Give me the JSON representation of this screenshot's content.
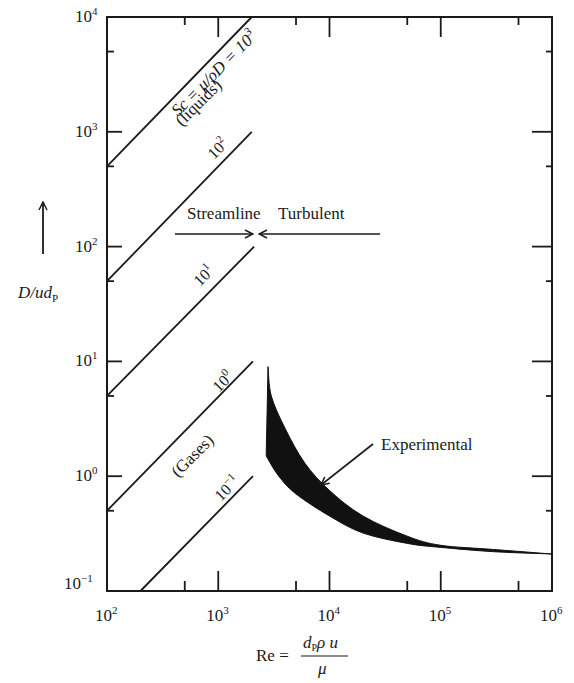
{
  "chart_data": {
    "type": "line",
    "title": "",
    "xlabel": "Re = d_P ρ u / μ",
    "ylabel": "D/ud_P",
    "xscale": "log",
    "yscale": "log",
    "xlim": [
      100,
      1000000
    ],
    "ylim": [
      0.1,
      10000
    ],
    "grid": false,
    "x_ticks": [
      {
        "value": 100,
        "label_base": "10",
        "label_exp": "2"
      },
      {
        "value": 1000,
        "label_base": "10",
        "label_exp": "3"
      },
      {
        "value": 10000,
        "label_base": "10",
        "label_exp": "4"
      },
      {
        "value": 100000,
        "label_base": "10",
        "label_exp": "5"
      },
      {
        "value": 1000000,
        "label_base": "10",
        "label_exp": "6"
      }
    ],
    "y_ticks": [
      {
        "value": 0.1,
        "label_base": "10",
        "label_exp": "−1"
      },
      {
        "value": 1,
        "label_base": "10",
        "label_exp": "0"
      },
      {
        "value": 10,
        "label_base": "10",
        "label_exp": "1"
      },
      {
        "value": 100,
        "label_base": "10",
        "label_exp": "2"
      },
      {
        "value": 1000,
        "label_base": "10",
        "label_exp": "3"
      },
      {
        "value": 10000,
        "label_base": "10",
        "label_exp": "4"
      }
    ],
    "minor_ticks_at": "5 × 10^n",
    "series": [
      {
        "name": "Sc = μ/ρD = 10³ (liquids)",
        "sc": 1000,
        "points": [
          [
            100,
            500
          ],
          [
            2000,
            10000
          ]
        ]
      },
      {
        "name": "10²",
        "sc": 100,
        "points": [
          [
            100,
            50
          ],
          [
            2000,
            1000
          ]
        ]
      },
      {
        "name": "10¹",
        "sc": 10,
        "points": [
          [
            100,
            5
          ],
          [
            2100,
            100
          ]
        ]
      },
      {
        "name": "10⁰ (Gases)",
        "sc": 1,
        "points": [
          [
            100,
            0.5
          ],
          [
            2050,
            10
          ]
        ]
      },
      {
        "name": "10⁻¹",
        "sc": 0.1,
        "points": [
          [
            200,
            0.1
          ],
          [
            2050,
            1
          ]
        ]
      }
    ],
    "experimental_band": {
      "name": "Experimental",
      "upper": [
        [
          2800,
          9
        ],
        [
          3000,
          5
        ],
        [
          4000,
          2.6
        ],
        [
          6000,
          1.3
        ],
        [
          10000,
          0.75
        ],
        [
          20000,
          0.45
        ],
        [
          50000,
          0.3
        ],
        [
          100000,
          0.25
        ],
        [
          300000,
          0.23
        ],
        [
          1000000,
          0.21
        ]
      ],
      "lower": [
        [
          2700,
          1.5
        ],
        [
          3500,
          1.0
        ],
        [
          5000,
          0.7
        ],
        [
          10000,
          0.45
        ],
        [
          20000,
          0.32
        ],
        [
          50000,
          0.26
        ],
        [
          100000,
          0.24
        ],
        [
          300000,
          0.22
        ],
        [
          1000000,
          0.21
        ]
      ]
    },
    "annotations": [
      {
        "text": "Streamline",
        "arrow": "→",
        "at_re": 2100
      },
      {
        "text": "Turbulent",
        "arrow": "←",
        "at_re": 2100
      },
      {
        "text": "Experimental",
        "points_to": [
          9000,
          0.95
        ]
      }
    ]
  },
  "labels": {
    "sc_main": "Sc = μ/ρD = 10",
    "sc_main_exp": "3",
    "liquids": "(liquids)",
    "sc2": "10",
    "sc2_exp": "2",
    "sc1": "10",
    "sc1_exp": "1",
    "sc0": "10",
    "sc0_exp": "0",
    "gases": "(Gases)",
    "scm1": "10",
    "scm1_exp": "−1",
    "streamline": "Streamline",
    "turbulent": "Turbulent",
    "experimental": "Experimental",
    "ylabel_main": "D/ud",
    "ylabel_sub": "P",
    "xlabel_re": "Re =",
    "xlabel_num": "d",
    "xlabel_num_sub": "P",
    "xlabel_num_rest": "ρ u",
    "xlabel_den": "μ"
  }
}
